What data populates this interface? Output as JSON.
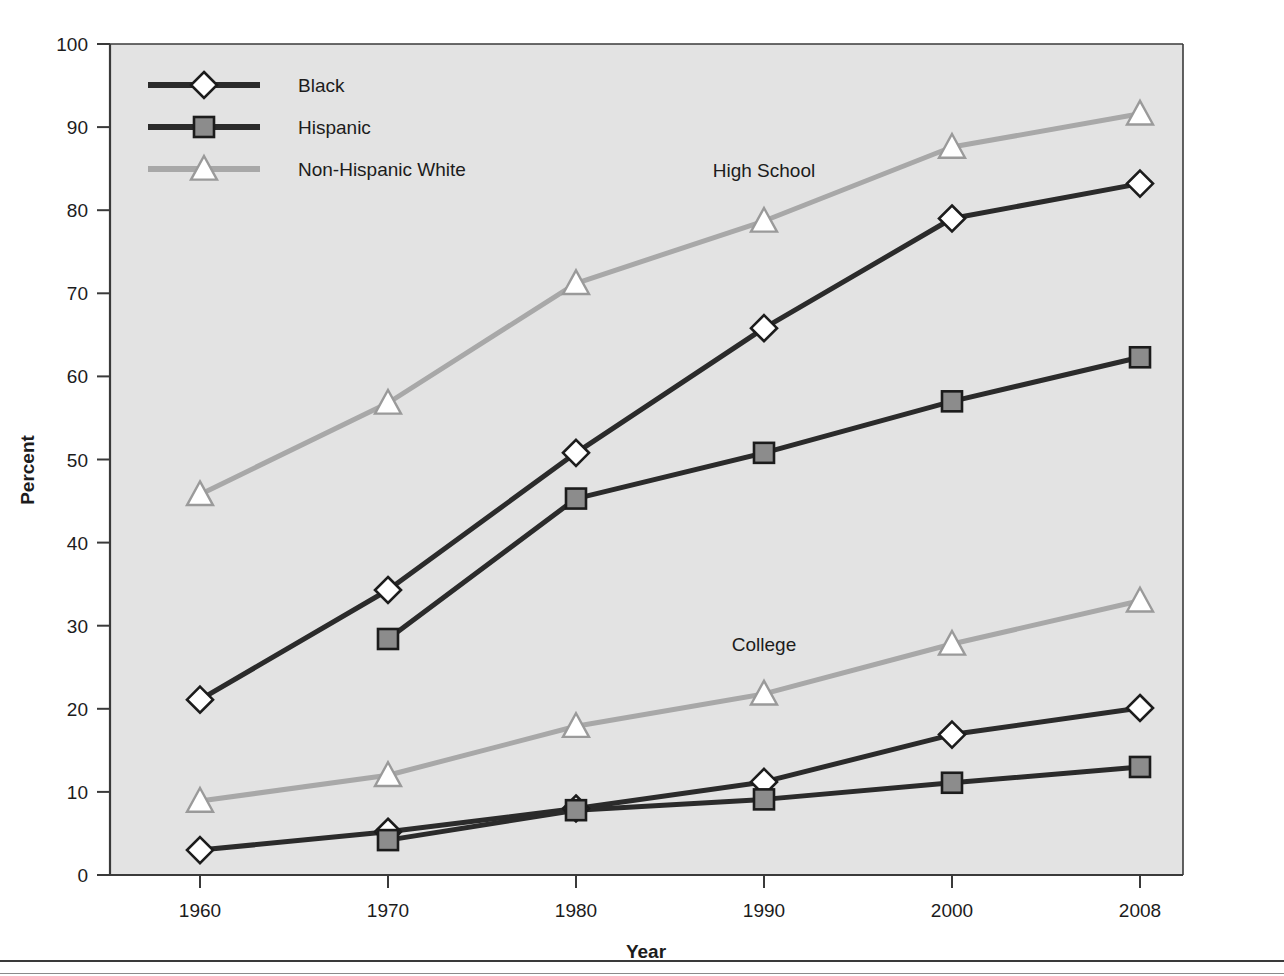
{
  "chart_data": {
    "type": "line",
    "title": "",
    "xlabel": "Year",
    "ylabel": "Percent",
    "categories": [
      "1960",
      "1970",
      "1980",
      "1990",
      "2000",
      "2008"
    ],
    "ylim": [
      0,
      100
    ],
    "ytick_step": 10,
    "yticks": [
      "0",
      "10",
      "20",
      "30",
      "40",
      "50",
      "60",
      "70",
      "80",
      "90",
      "100"
    ],
    "grid": false,
    "legend_position": "top-left",
    "legend_entries": [
      {
        "label": "Black",
        "marker": "diamond",
        "color": "#2b2b2b"
      },
      {
        "label": "Hispanic",
        "marker": "square",
        "color": "#2b2b2b"
      },
      {
        "label": "Non-Hispanic White",
        "marker": "triangle",
        "color": "#a8a8a8"
      }
    ],
    "annotations": [
      {
        "text": "High School",
        "x": "1990",
        "y": 84
      },
      {
        "text": "College",
        "x": "1990",
        "y": 27
      }
    ],
    "groups": [
      {
        "name": "High School",
        "series": [
          {
            "name": "Black",
            "marker": "diamond",
            "color": "#2b2b2b",
            "x": [
              "1960",
              "1970",
              "1980",
              "1990",
              "2000",
              "2008"
            ],
            "values": [
              21.1,
              34.3,
              50.8,
              65.8,
              79.0,
              83.2
            ]
          },
          {
            "name": "Hispanic",
            "marker": "square",
            "color": "#2b2b2b",
            "x": [
              "1970",
              "1980",
              "1990",
              "2000",
              "2008"
            ],
            "values": [
              28.4,
              45.3,
              50.8,
              57.0,
              62.3
            ]
          },
          {
            "name": "Non-Hispanic White",
            "marker": "triangle",
            "color": "#a8a8a8",
            "x": [
              "1960",
              "1970",
              "1980",
              "1990",
              "2000",
              "2008"
            ],
            "values": [
              45.8,
              56.8,
              71.2,
              78.7,
              87.6,
              91.6
            ]
          }
        ]
      },
      {
        "name": "College",
        "series": [
          {
            "name": "Black",
            "marker": "diamond",
            "color": "#2b2b2b",
            "x": [
              "1960",
              "1970",
              "1980",
              "1990",
              "2000",
              "2008"
            ],
            "values": [
              3.0,
              5.2,
              8.0,
              11.2,
              16.9,
              20.1
            ]
          },
          {
            "name": "Hispanic",
            "marker": "square",
            "color": "#2b2b2b",
            "x": [
              "1970",
              "1980",
              "1990",
              "2000",
              "2008"
            ],
            "values": [
              4.2,
              7.8,
              9.1,
              11.1,
              13.0
            ]
          },
          {
            "name": "Non-Hispanic White",
            "marker": "triangle",
            "color": "#a8a8a8",
            "x": [
              "1960",
              "1970",
              "1980",
              "1990",
              "2000",
              "2008"
            ],
            "values": [
              8.9,
              12.0,
              17.9,
              21.8,
              27.8,
              33.0
            ]
          }
        ]
      }
    ]
  },
  "colors": {
    "dark_line": "#2b2b2b",
    "light_line": "#a8a8a8",
    "plot_background": "#e3e3e3",
    "axis": "#3a3a3a",
    "marker_fill_white": "#ffffff",
    "marker_fill_gray": "#8c8c8c",
    "text": "#1c1c1c"
  }
}
